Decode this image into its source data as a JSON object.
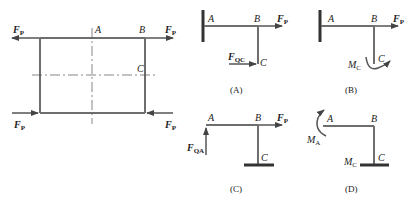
{
  "figure": {
    "main_frame": {
      "labels": {
        "force_top_left": "F",
        "force_top_left_sub": "P",
        "force_top_right": "F",
        "force_top_right_sub": "P",
        "force_bottom_left": "F",
        "force_bottom_left_sub": "P",
        "force_bottom_right": "F",
        "force_bottom_right_sub": "P",
        "point_a": "A",
        "point_b": "B",
        "point_c": "C"
      }
    },
    "options": [
      {
        "caption": "(A)",
        "point_a": "A",
        "point_b": "B",
        "point_c": "C",
        "force": "F",
        "force_sub": "P",
        "reaction": "F",
        "reaction_sub": "QC"
      },
      {
        "caption": "(B)",
        "point_a": "A",
        "point_b": "B",
        "point_c": "C",
        "force": "F",
        "force_sub": "P",
        "moment": "M",
        "moment_sub": "C"
      },
      {
        "caption": "(C)",
        "point_a": "A",
        "point_b": "B",
        "point_c": "C",
        "force": "F",
        "force_sub": "P",
        "reaction": "F",
        "reaction_sub": "QA"
      },
      {
        "caption": "(D)",
        "point_a": "A",
        "point_b": "B",
        "point_c": "C",
        "moment_a": "M",
        "moment_a_sub": "A",
        "moment_c": "M",
        "moment_c_sub": "C"
      }
    ]
  }
}
